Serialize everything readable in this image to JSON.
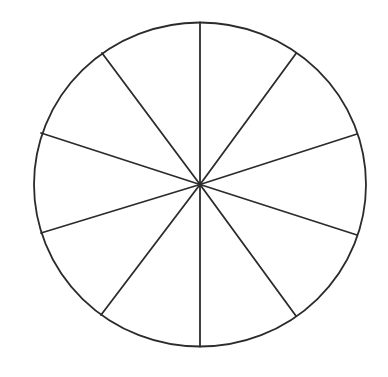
{
  "diagram": {
    "type": "divided-circle",
    "sector_count": 10,
    "center": {
      "x": 200,
      "y": 184.5
    },
    "radius_x": 166,
    "radius_y": 162,
    "stroke_color": "#2b2b2b",
    "fill_color": "#ffffff",
    "background": "#ffffff",
    "stroke_width": 1.8,
    "spoke_endpoints": [
      {
        "x": 200,
        "y": 22.5
      },
      {
        "x": 296,
        "y": 53.5
      },
      {
        "x": 357,
        "y": 134
      },
      {
        "x": 357,
        "y": 235
      },
      {
        "x": 296,
        "y": 316
      },
      {
        "x": 200,
        "y": 346.5
      },
      {
        "x": 101,
        "y": 315
      },
      {
        "x": 41,
        "y": 233
      },
      {
        "x": 41,
        "y": 133
      },
      {
        "x": 102,
        "y": 53
      }
    ]
  }
}
